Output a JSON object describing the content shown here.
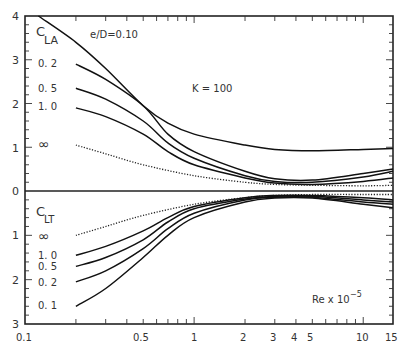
{
  "chart_data": {
    "type": "line",
    "title": "",
    "xlabel": "Re x 10^-5",
    "xscale": "log",
    "xlim": [
      0.1,
      15
    ],
    "x_tick_labels": [
      "0.1",
      "0.5",
      "1",
      "2",
      "3",
      "4",
      "5",
      "10",
      "15"
    ],
    "y_tick_labels_upper": [
      "4",
      "3",
      "2",
      "1",
      "0"
    ],
    "y_tick_labels_lower": [
      "1",
      "2",
      "3"
    ],
    "upper_panel": {
      "ylabel": "C_LA",
      "ylim": [
        0,
        4
      ],
      "annotation": "K = 100",
      "series": [
        {
          "name": "e/D=0.10",
          "x": [
            0.12,
            0.2,
            0.3,
            0.5,
            0.7,
            1,
            2,
            3,
            5,
            10,
            15
          ],
          "values": [
            4.0,
            3.4,
            2.8,
            1.95,
            1.55,
            1.3,
            1.05,
            0.95,
            0.92,
            0.95,
            0.97
          ]
        },
        {
          "name": "0.2",
          "x": [
            0.2,
            0.3,
            0.5,
            0.7,
            1,
            2,
            3,
            5,
            10,
            15
          ],
          "values": [
            2.9,
            2.55,
            1.95,
            1.3,
            0.9,
            0.45,
            0.28,
            0.25,
            0.4,
            0.5
          ]
        },
        {
          "name": "0.5",
          "x": [
            0.2,
            0.3,
            0.5,
            0.7,
            1,
            2,
            3,
            5,
            10,
            15
          ],
          "values": [
            2.35,
            2.1,
            1.6,
            1.1,
            0.75,
            0.35,
            0.22,
            0.2,
            0.32,
            0.45
          ]
        },
        {
          "name": "1.0",
          "x": [
            0.2,
            0.3,
            0.5,
            0.7,
            1,
            2,
            3,
            5,
            10,
            15
          ],
          "values": [
            1.9,
            1.7,
            1.3,
            0.9,
            0.6,
            0.3,
            0.18,
            0.15,
            0.22,
            0.3
          ]
        },
        {
          "name": "∞",
          "x": [
            0.2,
            0.3,
            0.5,
            1,
            2,
            3,
            5,
            10,
            15
          ],
          "values": [
            1.05,
            0.85,
            0.6,
            0.35,
            0.2,
            0.15,
            0.13,
            0.12,
            0.13
          ],
          "style": "dotted"
        }
      ]
    },
    "lower_panel": {
      "ylabel": "C_LT",
      "ylim": [
        0,
        3
      ],
      "inverted": true,
      "series": [
        {
          "name": "∞",
          "x": [
            0.2,
            0.3,
            0.5,
            1,
            2,
            3,
            5,
            10,
            15
          ],
          "values": [
            1.0,
            0.8,
            0.55,
            0.3,
            0.15,
            0.1,
            0.08,
            0.08,
            0.08
          ],
          "style": "dotted"
        },
        {
          "name": "1.0",
          "x": [
            0.2,
            0.3,
            0.5,
            0.7,
            1,
            2,
            3,
            5,
            10,
            15
          ],
          "values": [
            1.45,
            1.25,
            0.9,
            0.6,
            0.35,
            0.15,
            0.1,
            0.1,
            0.15,
            0.2
          ]
        },
        {
          "name": "0.5",
          "x": [
            0.2,
            0.3,
            0.5,
            0.7,
            1,
            2,
            3,
            5,
            10,
            15
          ],
          "values": [
            1.7,
            1.5,
            1.1,
            0.7,
            0.4,
            0.18,
            0.12,
            0.12,
            0.2,
            0.25
          ]
        },
        {
          "name": "0.2",
          "x": [
            0.2,
            0.3,
            0.5,
            0.7,
            1,
            2,
            3,
            5,
            10,
            15
          ],
          "values": [
            2.05,
            1.8,
            1.3,
            0.85,
            0.5,
            0.2,
            0.14,
            0.14,
            0.25,
            0.3
          ]
        },
        {
          "name": "0.1",
          "x": [
            0.2,
            0.3,
            0.5,
            0.7,
            1,
            2,
            3,
            5,
            10,
            15
          ],
          "values": [
            2.6,
            2.2,
            1.5,
            1.0,
            0.6,
            0.25,
            0.16,
            0.16,
            0.3,
            0.38
          ]
        }
      ]
    },
    "grid": false,
    "legend": "inline labels at left of curves"
  },
  "labels": {
    "cla_c": "C",
    "cla_sub": "LA",
    "clt_c": "C",
    "clt_sub": "LT",
    "ed": "e/D=0.10",
    "k": "K = 100",
    "re": "Re x 10",
    "re_exp": "−5",
    "upper_02": "0. 2",
    "upper_05": "0. 5",
    "upper_10": "1. 0",
    "upper_inf": "∞",
    "lower_inf": "∞",
    "lower_10": "1. 0",
    "lower_05": "0. 5",
    "lower_02": "0. 2",
    "lower_01": "0. 1"
  },
  "axis": {
    "y_upper": [
      "4",
      "3",
      "2",
      "1",
      "0"
    ],
    "y_lower": [
      "1",
      "2",
      "3"
    ],
    "x": [
      "0.1",
      "0.5",
      "1",
      "2",
      "3",
      "4",
      "5",
      "10",
      "15"
    ]
  }
}
